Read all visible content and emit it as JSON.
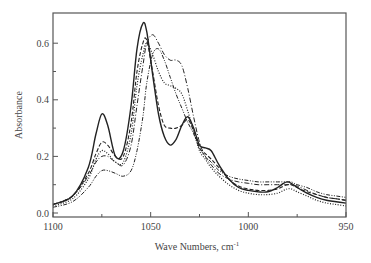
{
  "chart_data": {
    "type": "line",
    "title": "",
    "xlabel": "Wave Numbers,  cm",
    "xlabel_superscript": "-1",
    "ylabel": "Absorbance",
    "xlim": [
      1100,
      950
    ],
    "ylim": [
      -0.01,
      0.72
    ],
    "x_reversed": true,
    "x_ticks": [
      1100,
      1050,
      1000,
      950
    ],
    "x_tick_labels": [
      "1100",
      "1050",
      "1000",
      "950"
    ],
    "x_minor_ticks": [
      1075,
      1025,
      975
    ],
    "y_ticks": [
      0.0,
      0.2,
      0.4,
      0.6
    ],
    "y_tick_labels": [
      "0.0",
      "0.2",
      "0.4",
      "0.6"
    ],
    "y_minor_ticks": [
      0.1,
      0.3,
      0.5
    ],
    "grid": false,
    "legend": "none",
    "x": [
      1100,
      1090,
      1082,
      1078,
      1075,
      1072,
      1068,
      1064,
      1060,
      1057,
      1054,
      1052,
      1049,
      1046,
      1043,
      1040,
      1037,
      1034,
      1031,
      1028,
      1025,
      1022,
      1019,
      1015,
      1010,
      1005,
      1000,
      995,
      990,
      985,
      982,
      980,
      978,
      975,
      970,
      965,
      960,
      955,
      950
    ],
    "series": [
      {
        "name": "solid",
        "style": "solid",
        "values": [
          0.03,
          0.06,
          0.16,
          0.28,
          0.35,
          0.31,
          0.2,
          0.22,
          0.38,
          0.58,
          0.67,
          0.64,
          0.49,
          0.35,
          0.27,
          0.24,
          0.26,
          0.31,
          0.34,
          0.3,
          0.24,
          0.23,
          0.22,
          0.17,
          0.12,
          0.09,
          0.08,
          0.075,
          0.075,
          0.09,
          0.105,
          0.11,
          0.105,
          0.09,
          0.07,
          0.055,
          0.045,
          0.04,
          0.035
        ]
      },
      {
        "name": "dashed",
        "style": "dashed",
        "values": [
          0.03,
          0.06,
          0.14,
          0.21,
          0.25,
          0.24,
          0.2,
          0.2,
          0.32,
          0.5,
          0.6,
          0.61,
          0.5,
          0.38,
          0.31,
          0.3,
          0.3,
          0.31,
          0.33,
          0.29,
          0.23,
          0.21,
          0.19,
          0.16,
          0.12,
          0.095,
          0.085,
          0.08,
          0.08,
          0.085,
          0.095,
          0.1,
          0.1,
          0.09,
          0.075,
          0.065,
          0.055,
          0.05,
          0.045
        ]
      },
      {
        "name": "dotted",
        "style": "dotted",
        "values": [
          0.025,
          0.05,
          0.12,
          0.19,
          0.22,
          0.21,
          0.18,
          0.18,
          0.28,
          0.45,
          0.56,
          0.6,
          0.56,
          0.5,
          0.46,
          0.45,
          0.44,
          0.42,
          0.36,
          0.29,
          0.22,
          0.19,
          0.16,
          0.13,
          0.1,
          0.08,
          0.07,
          0.065,
          0.065,
          0.07,
          0.08,
          0.085,
          0.085,
          0.075,
          0.06,
          0.045,
          0.035,
          0.03,
          0.025
        ]
      },
      {
        "name": "dash-dot",
        "style": "dashdot",
        "values": [
          0.03,
          0.06,
          0.13,
          0.18,
          0.2,
          0.2,
          0.18,
          0.17,
          0.24,
          0.38,
          0.52,
          0.6,
          0.63,
          0.6,
          0.56,
          0.54,
          0.54,
          0.52,
          0.44,
          0.34,
          0.25,
          0.2,
          0.17,
          0.14,
          0.12,
          0.11,
          0.105,
          0.1,
          0.1,
          0.1,
          0.1,
          0.1,
          0.1,
          0.095,
          0.08,
          0.065,
          0.055,
          0.05,
          0.045
        ]
      },
      {
        "name": "dash-dot-dot",
        "style": "dashdotdot",
        "values": [
          0.02,
          0.04,
          0.09,
          0.13,
          0.15,
          0.15,
          0.14,
          0.13,
          0.15,
          0.22,
          0.34,
          0.46,
          0.56,
          0.58,
          0.54,
          0.48,
          0.42,
          0.37,
          0.32,
          0.28,
          0.23,
          0.2,
          0.18,
          0.15,
          0.13,
          0.12,
          0.115,
          0.11,
          0.11,
          0.11,
          0.11,
          0.11,
          0.11,
          0.1,
          0.09,
          0.075,
          0.065,
          0.06,
          0.055
        ]
      }
    ]
  }
}
